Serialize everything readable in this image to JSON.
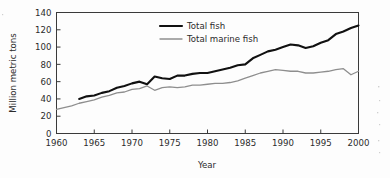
{
  "chart_data": {
    "type": "line",
    "title": "",
    "xlabel": "Year",
    "ylabel": "Million metric tons",
    "xlim": [
      1960,
      2000
    ],
    "ylim": [
      0,
      140
    ],
    "xticks": [
      1960,
      1965,
      1970,
      1975,
      1980,
      1985,
      1990,
      1995,
      2000
    ],
    "yticks": [
      0,
      20,
      40,
      60,
      80,
      100,
      120,
      140
    ],
    "grid": false,
    "legend_position": "upper-center",
    "series": [
      {
        "name": "Total fish",
        "color": "#111111",
        "linewidth": 2.1,
        "x": [
          1963,
          1964,
          1965,
          1966,
          1967,
          1968,
          1969,
          1970,
          1971,
          1972,
          1973,
          1974,
          1975,
          1976,
          1977,
          1978,
          1979,
          1980,
          1981,
          1982,
          1983,
          1984,
          1985,
          1986,
          1987,
          1988,
          1989,
          1990,
          1991,
          1992,
          1993,
          1994,
          1995,
          1996,
          1997,
          1998,
          1999,
          2000
        ],
        "values": [
          40,
          43,
          44,
          47,
          49,
          53,
          55,
          58,
          60,
          57,
          66,
          64,
          63,
          67,
          67,
          69,
          70,
          70,
          72,
          74,
          76,
          79,
          80,
          87,
          91,
          95,
          97,
          100,
          103,
          102,
          99,
          101,
          105,
          108,
          115,
          118,
          122,
          125
        ]
      },
      {
        "name": "Total marine fish",
        "color": "#8e8e8e",
        "linewidth": 1.3,
        "x": [
          1960,
          1961,
          1962,
          1963,
          1964,
          1965,
          1966,
          1967,
          1968,
          1969,
          1970,
          1971,
          1972,
          1973,
          1974,
          1975,
          1976,
          1977,
          1978,
          1979,
          1980,
          1981,
          1982,
          1983,
          1984,
          1985,
          1986,
          1987,
          1988,
          1989,
          1990,
          1991,
          1992,
          1993,
          1994,
          1995,
          1996,
          1997,
          1998,
          1999,
          2000
        ],
        "values": [
          28,
          30,
          32,
          35,
          37,
          39,
          42,
          44,
          47,
          48,
          51,
          52,
          55,
          50,
          53,
          54,
          53,
          54,
          56,
          56,
          57,
          58,
          58,
          59,
          61,
          64,
          67,
          70,
          72,
          74,
          73,
          72,
          72,
          70,
          70,
          71,
          72,
          74,
          75,
          68,
          72
        ]
      }
    ]
  },
  "axes": {
    "ylabel": "Million metric tons",
    "xlabel": "Year",
    "xtick_labels": [
      "1960",
      "1965",
      "1970",
      "1975",
      "1980",
      "1985",
      "1990",
      "1995",
      "2000"
    ],
    "ytick_labels": [
      "0",
      "20",
      "40",
      "60",
      "80",
      "100",
      "120",
      "140"
    ]
  },
  "legend": {
    "items": [
      {
        "label": "Total fish",
        "color": "#111111"
      },
      {
        "label": "Total marine fish",
        "color": "#8e8e8e"
      }
    ]
  }
}
